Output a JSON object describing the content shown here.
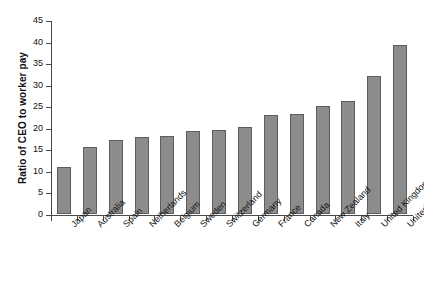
{
  "chart_data": {
    "type": "bar",
    "title": "",
    "xlabel": "",
    "ylabel": "Ratio of CEO to worker pay",
    "ylim": [
      0,
      45
    ],
    "ytick_step": 5,
    "yticks": [
      0,
      5,
      10,
      15,
      20,
      25,
      30,
      35,
      40,
      45
    ],
    "ytick_labels": [
      "0",
      "5",
      "10",
      "15",
      "20",
      "25",
      "30",
      "35",
      "40",
      "45"
    ],
    "grid": false,
    "legend": "none",
    "bar_color": "#8c8c8c",
    "bar_edge_color": "#5d5d5d",
    "axis_color": "#4a4a4a",
    "background": "#ffffff",
    "categories": [
      "Japan",
      "Australia",
      "Spain",
      "Netherlands",
      "Belgium",
      "Sweden",
      "Switzerland",
      "Germany",
      "France",
      "Canada",
      "New Zealand",
      "Italy",
      "United Kingdom",
      "United States"
    ],
    "values": [
      10.8,
      15.6,
      17.2,
      17.8,
      18.1,
      19.3,
      19.5,
      20.3,
      22.9,
      23.3,
      25.1,
      26.1,
      32.0,
      39.2
    ],
    "series": [
      {
        "name": "Ratio of CEO to worker pay",
        "values": [
          10.8,
          15.6,
          17.2,
          17.8,
          18.1,
          19.3,
          19.5,
          20.3,
          22.9,
          23.3,
          25.1,
          26.1,
          32.0,
          39.2
        ]
      }
    ]
  }
}
